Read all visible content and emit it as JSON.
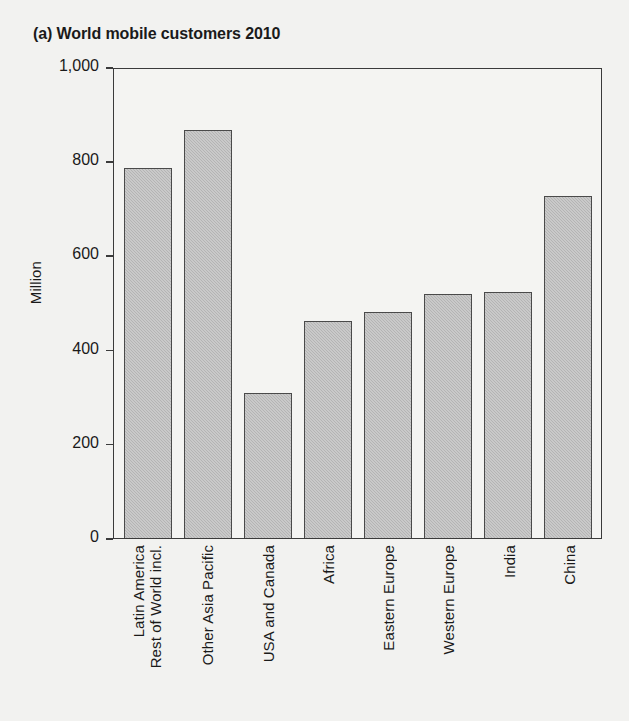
{
  "chart_data": {
    "type": "bar",
    "title": "(a) World mobile customers 2010",
    "xlabel": "",
    "ylabel": "Million",
    "ylim": [
      0,
      1000
    ],
    "yticks": [
      0,
      200,
      400,
      600,
      800,
      1000
    ],
    "ytick_labels": [
      "0",
      "200",
      "400",
      "600",
      "800",
      "1,000"
    ],
    "grid": false,
    "legend": null,
    "categories": [
      "Rest of World incl. Latin America",
      "Other Asia Pacific",
      "USA and Canada",
      "Africa",
      "Eastern Europe",
      "Western Europe",
      "India",
      "China"
    ],
    "category_lines": [
      [
        "Rest of World incl.",
        "Latin America"
      ],
      [
        "Other Asia Pacific"
      ],
      [
        "USA and Canada"
      ],
      [
        "Africa"
      ],
      [
        "Eastern Europe"
      ],
      [
        "Western Europe"
      ],
      [
        "India"
      ],
      [
        "China"
      ]
    ],
    "values": [
      790,
      870,
      310,
      462,
      481,
      520,
      525,
      730
    ],
    "bar_fill_color": "#b9b9b9",
    "bar_edge_color": "#4a4a4a",
    "background_color": "#f2f2f0"
  }
}
